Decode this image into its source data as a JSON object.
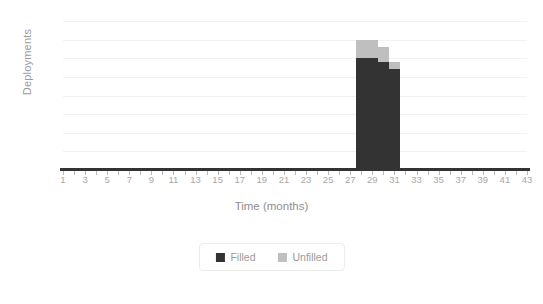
{
  "chart_data": {
    "type": "bar",
    "title": "",
    "subtitle": "",
    "xlabel": "Time (months)",
    "ylabel": "Deployments",
    "xlim": [
      1,
      43
    ],
    "ylim": [
      0,
      40
    ],
    "grid": true,
    "stacked": true,
    "legend_position": "bottom",
    "ytick_labels": [
      "0",
      "5",
      "10",
      "15",
      "20",
      "25",
      "30",
      "35",
      "40"
    ],
    "ytick_values": [
      0,
      5,
      10,
      15,
      20,
      25,
      30,
      35,
      40
    ],
    "xtick_labels": [
      "1",
      "3",
      "5",
      "7",
      "9",
      "11",
      "13",
      "15",
      "17",
      "19",
      "21",
      "23",
      "25",
      "27",
      "29",
      "31",
      "33",
      "35",
      "37",
      "39",
      "41",
      "43"
    ],
    "xtick_values": [
      1,
      3,
      5,
      7,
      9,
      11,
      13,
      15,
      17,
      19,
      21,
      23,
      25,
      27,
      29,
      31,
      33,
      35,
      37,
      39,
      41,
      43
    ],
    "x": [
      1,
      2,
      3,
      4,
      5,
      6,
      7,
      8,
      9,
      10,
      11,
      12,
      13,
      14,
      15,
      16,
      17,
      18,
      19,
      20,
      21,
      22,
      23,
      24,
      25,
      26,
      27,
      28,
      29,
      30,
      31,
      32,
      33,
      34,
      35,
      36,
      37,
      38,
      39,
      40,
      41,
      42,
      43
    ],
    "series": [
      {
        "name": "Filled",
        "color": "#333333",
        "values": [
          0,
          0,
          0,
          0,
          0,
          0,
          0,
          0,
          0,
          0,
          0,
          0,
          0,
          0,
          0,
          0,
          0,
          0,
          0,
          0,
          0,
          0,
          0,
          0,
          0,
          0,
          0,
          30,
          30,
          29,
          27,
          0,
          0,
          0,
          0,
          0,
          0,
          0,
          0,
          0,
          0,
          0,
          0
        ]
      },
      {
        "name": "Unfilled",
        "color": "#bfbfbf",
        "values": [
          0,
          0,
          0,
          0,
          0,
          0,
          0,
          0,
          0,
          0,
          0,
          0,
          0,
          0,
          0,
          0,
          0,
          0,
          0,
          0,
          0,
          0,
          0,
          0,
          0,
          0,
          0,
          5,
          5,
          4,
          2,
          0,
          0,
          0,
          0,
          0,
          0,
          0,
          0,
          0,
          0,
          0,
          0
        ]
      }
    ]
  },
  "legend": {
    "items": [
      {
        "label": "Filled",
        "color": "#333333"
      },
      {
        "label": "Unfilled",
        "color": "#bfbfbf"
      }
    ]
  }
}
